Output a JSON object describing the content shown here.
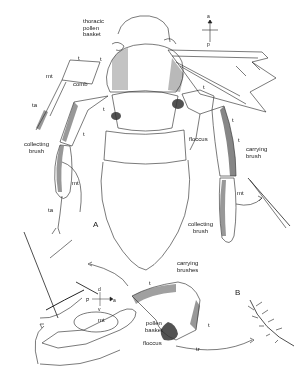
{
  "figure": {
    "panels": [
      "A",
      "B"
    ],
    "labels": {
      "thoracic_pollen_basket": "thoracic\npollen\nbasket",
      "comb": "comb",
      "floccus_a": "floccus",
      "floccus_b": "floccus",
      "carrying_brush": "carrying\nbrush",
      "carrying_brushes": "carrying\nbrushes",
      "collecting_brush_left": "collecting\nbrush",
      "collecting_brush_right": "collecting\nbrush",
      "pollen_basket": "pollen\nbasket",
      "mt_upper": "mt",
      "mt_lower": "mt",
      "mt_right": "mt",
      "mt_inset": "mt",
      "ta_upper": "ta",
      "ta_lower": "ta",
      "t_1": "t",
      "t_2": "t",
      "t_3": "t",
      "t_4": "t",
      "t_5": "t",
      "t_6": "t",
      "t_7": "t",
      "t_b1": "t",
      "t_b2": "t",
      "tr": "tr",
      "panel_a": "A",
      "panel_b": "B"
    },
    "compass_top": {
      "up": "a",
      "down": "p"
    },
    "compass_bottom": {
      "up": "d",
      "down": "v",
      "left": "P",
      "right": "a"
    }
  }
}
